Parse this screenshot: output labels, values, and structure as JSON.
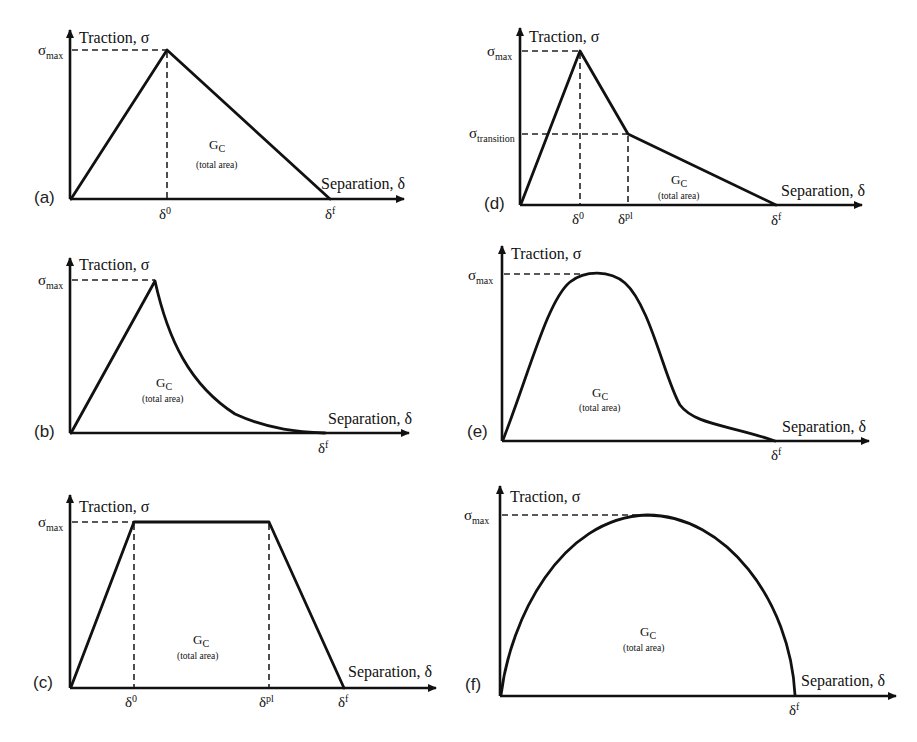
{
  "figure": {
    "common": {
      "y_axis_label": "Traction, σ",
      "x_axis_label": "Separation, δ",
      "sigma_symbol": "σ",
      "sigma_max_sub": "max",
      "delta_symbol": "δ",
      "area_symbol": "G",
      "area_sub": "C",
      "area_note": "(total area)"
    },
    "panels": [
      {
        "id": "(a)",
        "shape": "bilinear (triangular)",
        "x_ticks": [
          {
            "base": "δ",
            "sup": "0"
          },
          {
            "base": "δ",
            "sup": "f"
          }
        ],
        "y_ticks": [
          {
            "base": "σ",
            "sub": "max"
          }
        ]
      },
      {
        "id": "(b)",
        "shape": "linear-exponential",
        "x_ticks": [
          {
            "base": "δ",
            "sup": "f"
          }
        ],
        "y_ticks": [
          {
            "base": "σ",
            "sub": "max"
          }
        ]
      },
      {
        "id": "(c)",
        "shape": "trapezoidal",
        "x_ticks": [
          {
            "base": "δ",
            "sup": "0"
          },
          {
            "base": "δ",
            "sup": "pl"
          },
          {
            "base": "δ",
            "sup": "f"
          }
        ],
        "y_ticks": [
          {
            "base": "σ",
            "sub": "max"
          }
        ]
      },
      {
        "id": "(d)",
        "shape": "trilinear",
        "x_ticks": [
          {
            "base": "δ",
            "sup": "0"
          },
          {
            "base": "δ",
            "sup": "pl"
          },
          {
            "base": "δ",
            "sup": "f"
          }
        ],
        "y_ticks": [
          {
            "base": "σ",
            "sub": "max"
          },
          {
            "base": "σ",
            "sub": "transition"
          }
        ]
      },
      {
        "id": "(e)",
        "shape": "polynomial",
        "x_ticks": [
          {
            "base": "δ",
            "sup": "f"
          }
        ],
        "y_ticks": [
          {
            "base": "σ",
            "sub": "max"
          }
        ]
      },
      {
        "id": "(f)",
        "shape": "parabolic / elliptical",
        "x_ticks": [
          {
            "base": "δ",
            "sup": "f"
          }
        ],
        "y_ticks": [
          {
            "base": "σ",
            "sub": "max"
          }
        ]
      }
    ],
    "colors": {
      "line": "#111111",
      "background": "#ffffff"
    }
  }
}
